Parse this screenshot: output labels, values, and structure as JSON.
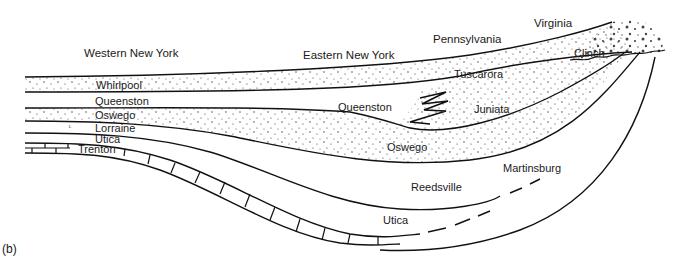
{
  "figure": {
    "panel_label": "(b)",
    "regions": [
      {
        "id": "western-ny",
        "label": "Western New York",
        "x": 84,
        "y": 47
      },
      {
        "id": "eastern-ny",
        "label": "Eastern New York",
        "x": 303,
        "y": 49
      },
      {
        "id": "pennsylvania",
        "label": "Pennsylvania",
        "x": 433,
        "y": 33
      },
      {
        "id": "virginia",
        "label": "Virginia",
        "x": 534,
        "y": 17
      }
    ],
    "units": [
      {
        "id": "whirlpool",
        "label": "Whirlpool",
        "x": 96,
        "y": 80
      },
      {
        "id": "queenston-west",
        "label": "Queenston",
        "x": 95,
        "y": 96
      },
      {
        "id": "oswego-west",
        "label": "Oswego",
        "x": 95,
        "y": 110
      },
      {
        "id": "lorraine",
        "label": "Lorraine",
        "x": 95,
        "y": 123
      },
      {
        "id": "utica-west",
        "label": "Utica",
        "x": 95,
        "y": 134
      },
      {
        "id": "trenton",
        "label": "Trenton",
        "x": 78,
        "y": 144
      },
      {
        "id": "queenston-east",
        "label": "Queenston",
        "x": 338,
        "y": 101
      },
      {
        "id": "tuscarora",
        "label": "Tuscarora",
        "x": 454,
        "y": 68
      },
      {
        "id": "juniata",
        "label": "Juniata",
        "x": 474,
        "y": 103
      },
      {
        "id": "clinch",
        "label": "Clinch",
        "x": 574,
        "y": 47
      },
      {
        "id": "oswego-east",
        "label": "Oswego",
        "x": 387,
        "y": 141
      },
      {
        "id": "martinsburg",
        "label": "Martinsburg",
        "x": 503,
        "y": 162
      },
      {
        "id": "reedsville",
        "label": "Reedsville",
        "x": 411,
        "y": 181
      },
      {
        "id": "utica-east",
        "label": "Utica",
        "x": 383,
        "y": 214
      }
    ]
  }
}
